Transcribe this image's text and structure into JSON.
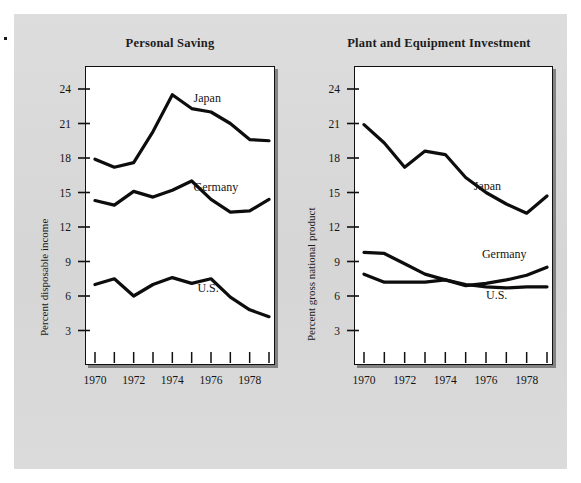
{
  "page": {
    "background_color": "#d9d9d9",
    "paper_color": "#ffffff",
    "ink_color": "#111111"
  },
  "chart_data": [
    {
      "type": "line",
      "id": "personal-saving",
      "title": "Personal Saving",
      "xlabel": "",
      "ylabel": "Percent disposable income",
      "x": [
        1970,
        1971,
        1972,
        1973,
        1974,
        1975,
        1976,
        1977,
        1978,
        1979
      ],
      "xlim": [
        1970,
        1979
      ],
      "ylim": [
        0,
        26
      ],
      "yticks": [
        3,
        6,
        9,
        12,
        15,
        18,
        21,
        24
      ],
      "xticks": [
        1970,
        1971,
        1972,
        1973,
        1974,
        1975,
        1976,
        1977,
        1978,
        1979
      ],
      "xtick_labels": [
        "1970",
        "",
        "1972",
        "",
        "1974",
        "",
        "1976",
        "",
        "1978",
        ""
      ],
      "grid": false,
      "legend_position": "inline-annotation",
      "series": [
        {
          "name": "Japan",
          "label": "Japan",
          "label_x": 1975.1,
          "label_y": 23.1,
          "values": [
            17.9,
            17.2,
            17.6,
            20.3,
            23.5,
            22.3,
            22.0,
            21.0,
            19.6,
            19.5
          ]
        },
        {
          "name": "Germany",
          "label": "Germany",
          "label_x": 1975.1,
          "label_y": 15.4,
          "values": [
            14.3,
            13.9,
            15.1,
            14.6,
            15.2,
            16.0,
            14.4,
            13.3,
            13.4,
            14.4
          ]
        },
        {
          "name": "U.S.",
          "label": "U.S.",
          "label_x": 1975.3,
          "label_y": 6.6,
          "values": [
            7.0,
            7.5,
            6.0,
            7.0,
            7.6,
            7.1,
            7.5,
            5.9,
            4.8,
            4.2
          ]
        }
      ]
    },
    {
      "type": "line",
      "id": "plant-equipment-investment",
      "title": "Plant and Equipment Investment",
      "xlabel": "",
      "ylabel": "Percent gross national product",
      "x": [
        1970,
        1971,
        1972,
        1973,
        1974,
        1975,
        1976,
        1977,
        1978,
        1979
      ],
      "xlim": [
        1970,
        1979
      ],
      "ylim": [
        0,
        26
      ],
      "yticks": [
        3,
        6,
        9,
        12,
        15,
        18,
        21,
        24
      ],
      "xticks": [
        1970,
        1971,
        1972,
        1973,
        1974,
        1975,
        1976,
        1977,
        1978,
        1979
      ],
      "xtick_labels": [
        "1970",
        "",
        "1972",
        "",
        "1974",
        "",
        "1976",
        "",
        "1978",
        ""
      ],
      "grid": false,
      "legend_position": "inline-annotation",
      "series": [
        {
          "name": "Japan",
          "label": "Japan",
          "label_x": 1975.4,
          "label_y": 15.5,
          "values": [
            20.9,
            19.3,
            17.2,
            18.6,
            18.3,
            16.3,
            15.0,
            14.0,
            13.2,
            14.7
          ]
        },
        {
          "name": "Germany",
          "label": "Germany",
          "label_x": 1975.8,
          "label_y": 9.6,
          "values": [
            9.8,
            9.7,
            8.8,
            7.9,
            7.4,
            6.9,
            7.1,
            7.4,
            7.8,
            8.5
          ]
        },
        {
          "name": "U.S.",
          "label": "U.S.",
          "label_x": 1976.0,
          "label_y": 6.0,
          "values": [
            7.9,
            7.2,
            7.2,
            7.2,
            7.4,
            7.0,
            6.8,
            6.7,
            6.8,
            6.8
          ]
        }
      ]
    }
  ]
}
